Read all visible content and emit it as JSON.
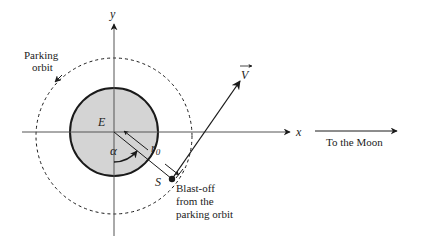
{
  "diagram": {
    "type": "orbital-mechanics",
    "labels": {
      "y_axis": "y",
      "x_axis": "x",
      "earth": "E",
      "parking_orbit_line1": "Parking",
      "parking_orbit_line2": "orbit",
      "velocity": "V",
      "radius": "r",
      "radius_subscript": "0",
      "angle": "α",
      "blast_off_point": "S",
      "blast_off_line1": "Blast-off",
      "blast_off_line2": "from the",
      "blast_off_line3": "parking orbit",
      "to_moon": "To the Moon"
    },
    "colors": {
      "earth_fill": "#d4d4d4",
      "stroke": "#1a1a1a",
      "axis": "#555555",
      "background": "#ffffff"
    }
  }
}
